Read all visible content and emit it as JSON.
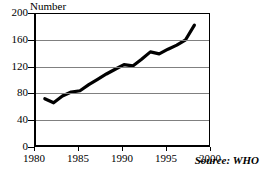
{
  "chart_data": {
    "type": "line",
    "title": "",
    "subtitle": "",
    "xlabel": "",
    "ylabel": "Number",
    "xlim": [
      1980,
      2000
    ],
    "ylim": [
      0,
      200
    ],
    "grid": true,
    "legend": null,
    "annotations": [
      {
        "name": "source",
        "text": "Source: WHO"
      }
    ],
    "yticks": [
      0,
      40,
      80,
      120,
      160,
      200
    ],
    "ytick_labels": [
      "0",
      "40",
      "80",
      "120",
      "160",
      "200"
    ],
    "xticks": [
      1980,
      1985,
      1990,
      1995,
      2000
    ],
    "xtick_labels": [
      "1980",
      "1985",
      "1990",
      "1995",
      "2000"
    ],
    "series": [
      {
        "name": "Number",
        "color": "#000000",
        "x": [
          1981,
          1982,
          1983,
          1984,
          1985,
          1986,
          1987,
          1988,
          1989,
          1990,
          1991,
          1992,
          1993,
          1994,
          1995,
          1996,
          1997,
          1998
        ],
        "values": [
          72,
          66,
          76,
          82,
          84,
          93,
          101,
          109,
          116,
          123,
          121,
          131,
          142,
          139,
          146,
          152,
          160,
          182
        ]
      }
    ]
  }
}
